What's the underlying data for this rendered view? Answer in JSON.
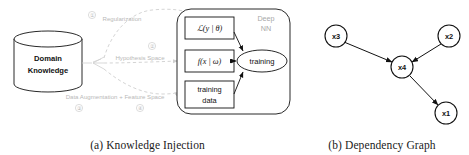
{
  "figure": {
    "panels": [
      {
        "id": "knowledge-injection",
        "caption": "(a) Knowledge Injection",
        "database": {
          "label_line1": "Domain",
          "label_line2": "Knowledge"
        },
        "container_label_line1": "Deep",
        "container_label_line2": "NN",
        "pathways": [
          {
            "marker": "①",
            "label": "Regularization"
          },
          {
            "marker": "②",
            "label": "Hypothesis Space"
          },
          {
            "marker": "③",
            "label": "Data Augmentation"
          },
          {
            "marker": "④",
            "label": "Feature Space"
          }
        ],
        "bottom_label": "Data Augmentation + Feature Space",
        "nodes": [
          {
            "id": "loss",
            "label": "ℒ(y | θ)",
            "shape": "rect"
          },
          {
            "id": "model",
            "label": "f(x | ω)",
            "shape": "rect"
          },
          {
            "id": "data",
            "label_line1": "training",
            "label_line2": "data",
            "shape": "rect"
          },
          {
            "id": "training",
            "label": "training",
            "shape": "ellipse"
          }
        ]
      },
      {
        "id": "dependency-graph",
        "caption": "(b) Dependency Graph",
        "nodes": [
          {
            "id": "x3",
            "label": "x3"
          },
          {
            "id": "x2",
            "label": "x2"
          },
          {
            "id": "x4",
            "label": "x4"
          },
          {
            "id": "x1",
            "label": "x1"
          }
        ],
        "edges": [
          {
            "from": "x3",
            "to": "x4"
          },
          {
            "from": "x2",
            "to": "x4"
          },
          {
            "from": "x4",
            "to": "x1"
          }
        ]
      }
    ],
    "colors": {
      "ink": "#111111",
      "faint": "#cfcfcf",
      "faint_text": "#b9b9b9",
      "background": "#ffffff"
    }
  }
}
